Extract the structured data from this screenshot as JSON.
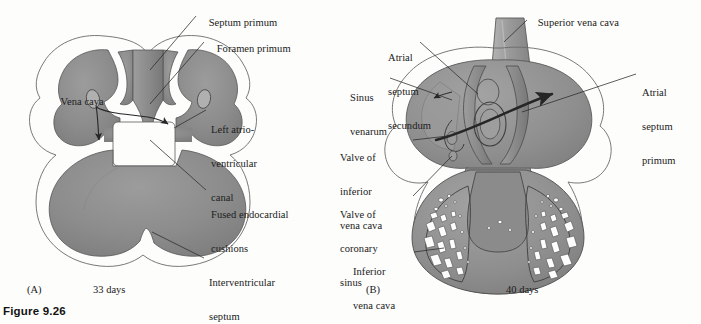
{
  "figure": {
    "caption": "Figure 9.26",
    "background_color": "#fdfdfc",
    "tissue_fill": "#8a8a8a",
    "tissue_fill_light": "#a6a6a6",
    "outline_color": "#4a4a4a",
    "leader_color": "#2a2a2a"
  },
  "panels": [
    {
      "id": "(A)",
      "age": "33 days",
      "labels": [
        {
          "name": "septum-primum",
          "lines": [
            "Septum primum"
          ]
        },
        {
          "name": "foramen-primum",
          "lines": [
            "Foramen primum"
          ]
        },
        {
          "name": "vena-cava",
          "lines": [
            "Vena cava"
          ]
        },
        {
          "name": "left-atrioventricular-canal",
          "lines": [
            "Left atrio-",
            "ventricular",
            "canal"
          ]
        },
        {
          "name": "fused-endocardial-cushions",
          "lines": [
            "Fused endocardial",
            "cushions"
          ]
        },
        {
          "name": "interventricular-septum",
          "lines": [
            "Interventricular",
            "septum"
          ]
        }
      ]
    },
    {
      "id": "(B)",
      "age": "40 days",
      "labels": [
        {
          "name": "superior-vena-cava",
          "lines": [
            "Superior vena cava"
          ]
        },
        {
          "name": "atrial-septum-secundum",
          "lines": [
            "Atrial",
            "septum",
            "secundum"
          ]
        },
        {
          "name": "sinus-venarum",
          "lines": [
            "Sinus",
            "venarum"
          ]
        },
        {
          "name": "valve-of-inferior-vena-cava",
          "lines": [
            "Valve of",
            "inferior",
            "vena cava"
          ]
        },
        {
          "name": "valve-of-coronary-sinus",
          "lines": [
            "Valve of",
            "coronary",
            "sinus"
          ]
        },
        {
          "name": "inferior-vena-cava",
          "lines": [
            "Inferior",
            "vena cava"
          ]
        },
        {
          "name": "atrial-septum-primum",
          "lines": [
            "Atrial",
            "septum",
            "primum"
          ]
        }
      ]
    }
  ],
  "text": {
    "a_septum_primum": "Septum primum",
    "a_foramen_primum": "Foramen primum",
    "a_vena_cava": "Vena cava",
    "a_lavc_1": "Left atrio-",
    "a_lavc_2": "ventricular",
    "a_lavc_3": "canal",
    "a_fec_1": "Fused endocardial",
    "a_fec_2": "cushions",
    "a_ivs_1": "Interventricular",
    "a_ivs_2": "septum",
    "a_panel_id": "(A)",
    "a_days": "33 days",
    "b_svc": "Superior vena cava",
    "b_ass_1": "Atrial",
    "b_ass_2": "septum",
    "b_ass_3": "secundum",
    "b_sv_1": "Sinus",
    "b_sv_2": "venarum",
    "b_vivc_1": "Valve of",
    "b_vivc_2": "inferior",
    "b_vivc_3": "vena cava",
    "b_vcs_1": "Valve of",
    "b_vcs_2": "coronary",
    "b_vcs_3": "sinus",
    "b_ivc_1": "Inferior",
    "b_ivc_2": "vena cava",
    "b_asp_1": "Atrial",
    "b_asp_2": "septum",
    "b_asp_3": "primum",
    "b_panel_id": "(B)",
    "b_days": "40 days",
    "figure_caption": "Figure 9.26"
  }
}
